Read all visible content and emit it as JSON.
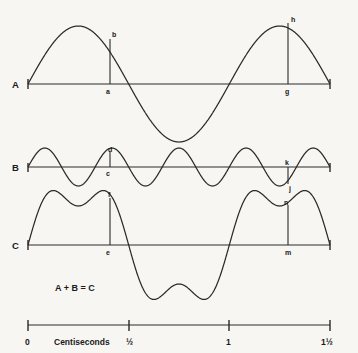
{
  "figure": {
    "equation": "A + B = C",
    "background_color": "#f7f6f2",
    "line_color": "#2a2a2a"
  },
  "rows": [
    {
      "label": "A",
      "name": "wave-a",
      "description": "fundamental sine wave"
    },
    {
      "label": "B",
      "name": "wave-b",
      "description": "higher frequency sine wave"
    },
    {
      "label": "C",
      "name": "wave-c",
      "description": "sum of A and B"
    }
  ],
  "point_labels": {
    "a": "a",
    "b": "b",
    "c": "c",
    "d": "d",
    "e": "e",
    "f": "f",
    "g": "g",
    "h": "h",
    "j": "j",
    "k": "k",
    "m": "m",
    "n": "n"
  },
  "time_axis": {
    "title": "Centiseconds",
    "ticks": [
      "0",
      "½",
      "1",
      "1½"
    ],
    "tick_values": [
      0,
      0.5,
      1,
      1.5
    ]
  },
  "chart_data": {
    "type": "line",
    "title": "A + B = C",
    "xlabel": "Centiseconds",
    "ylabel": "",
    "xlim": [
      0,
      1.5
    ],
    "xticks": [
      0,
      0.5,
      1,
      1.5
    ],
    "xticklabels": [
      "0",
      "½",
      "1",
      "1½"
    ],
    "grid": false,
    "legend": "none",
    "series": [
      {
        "name": "A",
        "type": "sine",
        "amplitude": 1.0,
        "cycles_over_range": 1.5,
        "phase_deg": 0,
        "baseline_y_px": 84,
        "annotations": [
          {
            "label": "a",
            "position": "on-axis",
            "x_centiseconds": 0.33
          },
          {
            "label": "b",
            "position": "on-curve",
            "x_centiseconds": 0.33
          },
          {
            "label": "g",
            "position": "on-axis",
            "x_centiseconds": 1.22
          },
          {
            "label": "h",
            "position": "on-curve",
            "x_centiseconds": 1.22
          }
        ]
      },
      {
        "name": "B",
        "type": "sine",
        "amplitude": 0.33,
        "cycles_over_range": 4.5,
        "phase_deg": 0,
        "baseline_y_px": 167,
        "annotations": [
          {
            "label": "c",
            "position": "on-axis",
            "x_centiseconds": 0.33
          },
          {
            "label": "d",
            "position": "on-curve",
            "x_centiseconds": 0.33
          },
          {
            "label": "k",
            "position": "on-axis",
            "x_centiseconds": 1.22
          },
          {
            "label": "j",
            "position": "on-curve",
            "x_centiseconds": 1.22
          }
        ]
      },
      {
        "name": "C",
        "type": "sum",
        "components": [
          "A",
          "B"
        ],
        "baseline_y_px": 245,
        "annotations": [
          {
            "label": "e",
            "position": "on-axis",
            "x_centiseconds": 0.33
          },
          {
            "label": "f",
            "position": "on-curve",
            "x_centiseconds": 0.33
          },
          {
            "label": "m",
            "position": "on-axis",
            "x_centiseconds": 1.22
          },
          {
            "label": "n",
            "position": "on-curve",
            "x_centiseconds": 1.22
          }
        ]
      }
    ]
  }
}
